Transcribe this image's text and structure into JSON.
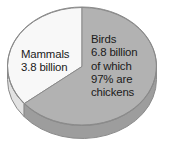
{
  "chart_data": {
    "type": "pie",
    "title": "",
    "subtitle": "",
    "xlabel": "",
    "ylabel": "",
    "grid": false,
    "legend_position": "none",
    "three_d": true,
    "categories": [
      "Birds",
      "Mammals"
    ],
    "values": [
      6.8,
      3.8
    ],
    "unit": "billion",
    "percentages": [
      64,
      36
    ],
    "slices": [
      {
        "name": "Birds",
        "value": 6.8,
        "unit": "billion",
        "percent": 64,
        "color": "#b2b2b2",
        "side_color": "#9d9d9d",
        "note": "97% are chickens",
        "label_lines": [
          "Birds",
          "6.8 billion",
          "of which",
          "97% are",
          "chickens"
        ]
      },
      {
        "name": "Mammals",
        "value": 3.8,
        "unit": "billion",
        "percent": 36,
        "color": "#f8f8f8",
        "side_color": "#e2e2e2",
        "note": "",
        "label_lines": [
          "Mammals",
          "3.8 billion"
        ]
      }
    ],
    "annotations": [
      "Mammals",
      "3.8 billion",
      "Birds",
      "6.8 billion",
      "of which",
      "97% are",
      "chickens"
    ]
  },
  "labels": {
    "mammals": {
      "line1": "Mammals",
      "line2": "3.8 billion"
    },
    "birds": {
      "line1": "Birds",
      "line2": "6.8 billion",
      "line3": "of which",
      "line4": "97% are",
      "line5": "chickens"
    }
  },
  "colors": {
    "background": "#ffffff",
    "birds_top": "#b2b2b2",
    "birds_side": "#9d9d9d",
    "mammals_top": "#f8f8f8",
    "mammals_side": "#e3e3e3",
    "outline": "#8a8a8a",
    "text": "#1a1a1a"
  }
}
